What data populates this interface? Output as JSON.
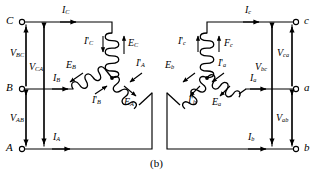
{
  "figure": {
    "caption": "(b)",
    "stroke_color": "#000000",
    "background_color": "#ffffff"
  },
  "left_circuit": {
    "name": "uppercase-phase-wye-winding",
    "terminals": [
      {
        "id": "terminal-C",
        "label": "C"
      },
      {
        "id": "terminal-B",
        "label": "B"
      },
      {
        "id": "terminal-A",
        "label": "A"
      }
    ],
    "line_currents": [
      {
        "id": "line-current-C",
        "sym": "I",
        "sub": "C",
        "prime": false
      },
      {
        "id": "line-current-B",
        "sym": "I",
        "sub": "B",
        "prime": false
      },
      {
        "id": "line-current-A",
        "sym": "I",
        "sub": "A",
        "prime": false
      }
    ],
    "voltages": [
      {
        "id": "voltage-BC",
        "sym": "V",
        "sub": "BC"
      },
      {
        "id": "voltage-CA",
        "sym": "V",
        "sub": "CA"
      },
      {
        "id": "voltage-AB",
        "sym": "V",
        "sub": "AB"
      }
    ],
    "winding_currents": [
      {
        "id": "winding-current-C",
        "sym": "I",
        "sub": "C",
        "prime": true
      },
      {
        "id": "winding-current-B",
        "sym": "I",
        "sub": "B",
        "prime": true
      },
      {
        "id": "winding-current-A",
        "sym": "I",
        "sub": "A",
        "prime": true
      }
    ],
    "emfs": [
      {
        "id": "emf-C",
        "sym": "E",
        "sub": "C"
      },
      {
        "id": "emf-B",
        "sym": "E",
        "sub": "B"
      },
      {
        "id": "emf-A",
        "sym": "E",
        "sub": "A"
      }
    ]
  },
  "right_circuit": {
    "name": "lowercase-phase-wye-winding",
    "terminals": [
      {
        "id": "terminal-c",
        "label": "c"
      },
      {
        "id": "terminal-a",
        "label": "a"
      },
      {
        "id": "terminal-b",
        "label": "b"
      }
    ],
    "line_currents": [
      {
        "id": "line-current-c",
        "sym": "I",
        "sub": "c",
        "prime": false
      },
      {
        "id": "line-current-a",
        "sym": "I",
        "sub": "a",
        "prime": false
      },
      {
        "id": "line-current-b",
        "sym": "I",
        "sub": "b",
        "prime": false
      }
    ],
    "voltages": [
      {
        "id": "voltage-bc",
        "sym": "V",
        "sub": "bc"
      },
      {
        "id": "voltage-ca",
        "sym": "V",
        "sub": "ca"
      },
      {
        "id": "voltage-ab",
        "sym": "V",
        "sub": "ab"
      }
    ],
    "winding_currents": [
      {
        "id": "winding-current-c",
        "sym": "I",
        "sub": "c",
        "prime": true
      },
      {
        "id": "winding-current-b",
        "sym": "I",
        "sub": "b",
        "prime": true
      },
      {
        "id": "winding-current-a",
        "sym": "I",
        "sub": "a",
        "prime": true
      }
    ],
    "emfs": [
      {
        "id": "mmf-c",
        "sym": "F",
        "sub": "c"
      },
      {
        "id": "emf-b",
        "sym": "E",
        "sub": "b"
      },
      {
        "id": "emf-a",
        "sym": "E",
        "sub": "a"
      }
    ]
  },
  "labels": {
    "L_term_C": "C",
    "L_term_B": "B",
    "L_term_A": "A",
    "L_IC": "I",
    "L_IC_sub": "C",
    "L_IB": "I",
    "L_IB_sub": "B",
    "L_IA": "I",
    "L_IA_sub": "A",
    "L_VBC": "V",
    "L_VBC_sub": "BC",
    "L_VCA": "V",
    "L_VCA_sub": "CA",
    "L_VAB": "V",
    "L_VAB_sub": "AB",
    "L_IpC": "I",
    "L_IpC_sub": "C",
    "L_IpB": "I",
    "L_IpB_sub": "B",
    "L_IpA": "I",
    "L_IpA_sub": "A",
    "L_EC": "E",
    "L_EC_sub": "C",
    "L_EB": "E",
    "L_EB_sub": "B",
    "L_EA": "E",
    "L_EA_sub": "A",
    "R_term_c": "c",
    "R_term_a": "a",
    "R_term_b": "b",
    "R_Ic": "I",
    "R_Ic_sub": "c",
    "R_Ia": "I",
    "R_Ia_sub": "a",
    "R_Ib": "I",
    "R_Ib_sub": "b",
    "R_Vbc": "V",
    "R_Vbc_sub": "bc",
    "R_Vca": "V",
    "R_Vca_sub": "ca",
    "R_Vab": "V",
    "R_Vab_sub": "ab",
    "R_Ipc": "I",
    "R_Ipc_sub": "c",
    "R_Ipb": "I",
    "R_Ipb_sub": "b",
    "R_Ipa": "I",
    "R_Ipa_sub": "a",
    "R_Fc": "F",
    "R_Fc_sub": "c",
    "R_Eb": "E",
    "R_Eb_sub": "b",
    "R_Ea": "E",
    "R_Ea_sub": "a",
    "prime": "'"
  }
}
